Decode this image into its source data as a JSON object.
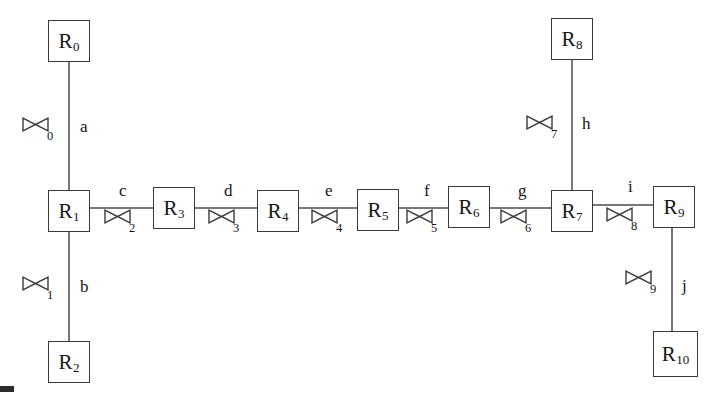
{
  "diagram": {
    "type": "pipe-network-schematic",
    "canvas": {
      "width": 718,
      "height": 396,
      "background": "#ffffff"
    },
    "colors": {
      "stroke": "#3a3a3a",
      "line": "#4a4a4a",
      "text": "#151515",
      "background": "#ffffff"
    },
    "nodes": [
      {
        "id": "R0",
        "base": "R",
        "sub": "0",
        "x": 48,
        "y": 20,
        "w": 42,
        "h": 42
      },
      {
        "id": "R1",
        "base": "R",
        "sub": "1",
        "x": 48,
        "y": 190,
        "w": 42,
        "h": 42
      },
      {
        "id": "R2",
        "base": "R",
        "sub": "2",
        "x": 48,
        "y": 341,
        "w": 42,
        "h": 42
      },
      {
        "id": "R3",
        "base": "R",
        "sub": "3",
        "x": 153,
        "y": 187,
        "w": 42,
        "h": 42
      },
      {
        "id": "R4",
        "base": "R",
        "sub": "4",
        "x": 257,
        "y": 190,
        "w": 42,
        "h": 42
      },
      {
        "id": "R5",
        "base": "R",
        "sub": "5",
        "x": 357,
        "y": 189,
        "w": 42,
        "h": 42
      },
      {
        "id": "R6",
        "base": "R",
        "sub": "6",
        "x": 448,
        "y": 186,
        "w": 42,
        "h": 42
      },
      {
        "id": "R7",
        "base": "R",
        "sub": "7",
        "x": 551,
        "y": 190,
        "w": 42,
        "h": 42
      },
      {
        "id": "R8",
        "base": "R",
        "sub": "8",
        "x": 551,
        "y": 18,
        "w": 42,
        "h": 42
      },
      {
        "id": "R9",
        "base": "R",
        "sub": "9",
        "x": 653,
        "y": 186,
        "w": 42,
        "h": 42
      },
      {
        "id": "R10",
        "base": "R",
        "sub": "10",
        "x": 653,
        "y": 331,
        "w": 45,
        "h": 46
      }
    ],
    "edges": [
      {
        "label": "a",
        "from": "R0",
        "to": "R1",
        "orientation": "vertical",
        "label_x": 80,
        "label_y": 118,
        "line": {
          "x1": 69,
          "y1": 62,
          "x2": 69,
          "y2": 190
        }
      },
      {
        "label": "b",
        "from": "R1",
        "to": "R2",
        "orientation": "vertical",
        "label_x": 80,
        "label_y": 278,
        "line": {
          "x1": 69,
          "y1": 232,
          "x2": 69,
          "y2": 341
        }
      },
      {
        "label": "c",
        "from": "R1",
        "to": "R3",
        "orientation": "horizontal",
        "label_x": 119,
        "label_y": 182,
        "line": {
          "x1": 90,
          "y1": 208,
          "x2": 153,
          "y2": 208
        }
      },
      {
        "label": "d",
        "from": "R3",
        "to": "R4",
        "orientation": "horizontal",
        "label_x": 224,
        "label_y": 182,
        "line": {
          "x1": 195,
          "y1": 208,
          "x2": 257,
          "y2": 208
        }
      },
      {
        "label": "e",
        "from": "R4",
        "to": "R5",
        "orientation": "horizontal",
        "label_x": 325,
        "label_y": 182,
        "line": {
          "x1": 299,
          "y1": 208,
          "x2": 357,
          "y2": 208
        }
      },
      {
        "label": "f",
        "from": "R5",
        "to": "R6",
        "orientation": "horizontal",
        "label_x": 424,
        "label_y": 182,
        "line": {
          "x1": 399,
          "y1": 208,
          "x2": 448,
          "y2": 208
        }
      },
      {
        "label": "g",
        "from": "R6",
        "to": "R7",
        "orientation": "horizontal",
        "label_x": 518,
        "label_y": 182,
        "line": {
          "x1": 490,
          "y1": 208,
          "x2": 551,
          "y2": 208
        }
      },
      {
        "label": "h",
        "from": "R8",
        "to": "R7",
        "orientation": "vertical",
        "label_x": 582,
        "label_y": 115,
        "line": {
          "x1": 572,
          "y1": 60,
          "x2": 572,
          "y2": 190
        }
      },
      {
        "label": "i",
        "from": "R7",
        "to": "R9",
        "orientation": "horizontal",
        "label_x": 628,
        "label_y": 178,
        "line": {
          "x1": 593,
          "y1": 205,
          "x2": 653,
          "y2": 205
        }
      },
      {
        "label": "j",
        "from": "R9",
        "to": "R10",
        "orientation": "vertical",
        "label_x": 682,
        "label_y": 277,
        "line": {
          "x1": 672,
          "y1": 228,
          "x2": 672,
          "y2": 331
        }
      }
    ],
    "valves": [
      {
        "id": "valve-0",
        "sub": "0",
        "on_edge": "a",
        "x": 22,
        "y": 117,
        "sub_x": 47,
        "sub_y": 130
      },
      {
        "id": "valve-1",
        "sub": "1",
        "on_edge": "b",
        "x": 22,
        "y": 276,
        "sub_x": 47,
        "sub_y": 289
      },
      {
        "id": "valve-2",
        "sub": "2",
        "on_edge": "c",
        "x": 104,
        "y": 209,
        "sub_x": 129,
        "sub_y": 222
      },
      {
        "id": "valve-3",
        "sub": "3",
        "on_edge": "d",
        "x": 208,
        "y": 209,
        "sub_x": 233,
        "sub_y": 222
      },
      {
        "id": "valve-4",
        "sub": "4",
        "on_edge": "e",
        "x": 311,
        "y": 209,
        "sub_x": 336,
        "sub_y": 222
      },
      {
        "id": "valve-5",
        "sub": "5",
        "on_edge": "f",
        "x": 406,
        "y": 209,
        "sub_x": 431,
        "sub_y": 222
      },
      {
        "id": "valve-6",
        "sub": "6",
        "on_edge": "g",
        "x": 500,
        "y": 209,
        "sub_x": 525,
        "sub_y": 222
      },
      {
        "id": "valve-7",
        "sub": "7",
        "on_edge": "h",
        "x": 526,
        "y": 115,
        "sub_x": 551,
        "sub_y": 128
      },
      {
        "id": "valve-8",
        "sub": "8",
        "on_edge": "i",
        "x": 606,
        "y": 207,
        "sub_x": 631,
        "sub_y": 220
      },
      {
        "id": "valve-9",
        "sub": "9",
        "on_edge": "j",
        "x": 625,
        "y": 270,
        "sub_x": 650,
        "sub_y": 283
      }
    ],
    "artifacts": [
      {
        "id": "corner-mark",
        "x": 0,
        "y": 386,
        "w": 14,
        "h": 6
      }
    ]
  }
}
